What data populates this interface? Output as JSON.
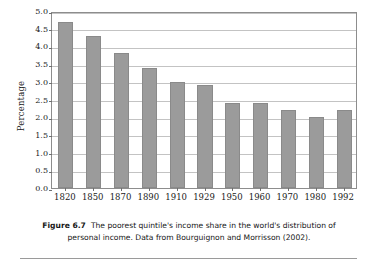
{
  "chart_data": {
    "type": "bar",
    "title": "",
    "xlabel": "",
    "ylabel": "Percentage",
    "categories": [
      "1820",
      "1850",
      "1870",
      "1890",
      "1910",
      "1929",
      "1950",
      "1960",
      "1970",
      "1980",
      "1992"
    ],
    "values": [
      4.7,
      4.3,
      3.8,
      3.4,
      3.0,
      2.9,
      2.4,
      2.4,
      2.2,
      2.0,
      2.2
    ],
    "ylim": [
      0.0,
      5.0
    ],
    "ytick_labels": [
      "5.0",
      "4.5",
      "4.0",
      "3.5",
      "3.0",
      "2.5",
      "2.0",
      "1.5",
      "1.0",
      "0.5",
      "0.0"
    ],
    "ytick_values": [
      5.0,
      4.5,
      4.0,
      3.5,
      3.0,
      2.5,
      2.0,
      1.5,
      1.0,
      0.5,
      0.0
    ],
    "grid": true,
    "legend": "none",
    "bar_color": "#9b9b9b",
    "grid_color": "#c3c3c3",
    "axis_color": "#8d8d8d"
  },
  "caption": {
    "label": "Figure 6.7",
    "text": "The poorest quintile's income share in the world's distribution of personal income. Data from Bourguignon and Morrisson (2002)."
  }
}
